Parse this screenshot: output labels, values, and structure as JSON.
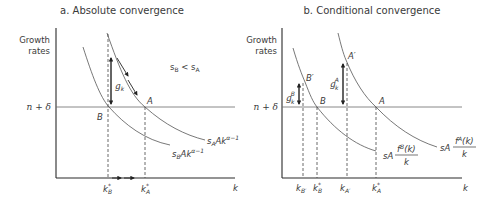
{
  "panel_a": {
    "title": "a. Absolute convergence",
    "y_label_1": "Growth",
    "y_label_2": "rates",
    "n_delta": "n + δ",
    "x_label": "k",
    "condition": {
      "s1": "s",
      "s1_sub": "B",
      "op": " < ",
      "s2": "s",
      "s2_sub": "A"
    },
    "g_label": "g",
    "g_sub": "k",
    "point_A": "A",
    "point_B": "B",
    "curve_A": {
      "s": "s",
      "s_sub": "A",
      "body": "Ak",
      "exp": "α−1"
    },
    "curve_B": {
      "s": "s",
      "s_sub": "B",
      "body": "Ak",
      "exp": "α−1"
    },
    "tick_kB": {
      "k": "k",
      "sup": "*",
      "sub": "B"
    },
    "tick_kA": {
      "k": "k",
      "sup": "*",
      "sub": "A"
    }
  },
  "panel_b": {
    "title": "b. Conditional convergence",
    "y_label_1": "Growth",
    "y_label_2": "rates",
    "n_delta": "n + δ",
    "x_label": "k",
    "point_A": "A",
    "point_B": "B",
    "point_A_prime": "A′",
    "point_B_prime": "B′",
    "gA": {
      "g": "g",
      "sup": "A",
      "sub": "k"
    },
    "gB": {
      "g": "g",
      "sup": "B",
      "sub": "k"
    },
    "curve_A": {
      "prefix": "sA",
      "num": "f",
      "num_sup": "A",
      "num_tail": "(k)",
      "den": "k"
    },
    "curve_B": {
      "prefix": "sA",
      "num": "f",
      "num_sup": "B",
      "num_tail": "(k)",
      "den": "k"
    },
    "tick_kBp": {
      "k": "k",
      "sub": "B′"
    },
    "tick_kB": {
      "k": "k",
      "sup": "*",
      "sub": "B"
    },
    "tick_kAp": {
      "k": "k",
      "sub": "A′"
    },
    "tick_kA": {
      "k": "k",
      "sup": "*",
      "sub": "A"
    }
  }
}
